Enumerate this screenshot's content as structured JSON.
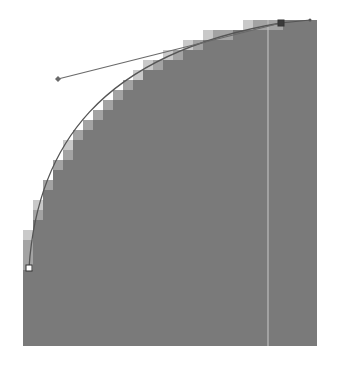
{
  "diagram": {
    "colors": {
      "background": "#ffffff",
      "fill": "#7a7a7a",
      "fill_dark": "#727272",
      "edge_light": "#c9c9c9",
      "edge_mid": "#a3a3a3",
      "path_stroke": "#555555",
      "handle_stroke": "#6a6a6a",
      "guide_line": "#bdbdbd"
    },
    "fill_rect": {
      "x": 23,
      "y": 20,
      "right": 317,
      "bottom": 346
    },
    "pixel_size": 10,
    "guide_x": 268,
    "anchors": [
      {
        "name": "top-anchor",
        "x": 281,
        "y": 23,
        "selected": true
      },
      {
        "name": "bottom-anchor",
        "x": 29,
        "y": 268,
        "selected": false
      }
    ],
    "handle": {
      "from": {
        "x": 281,
        "y": 23
      },
      "to": {
        "x": 58,
        "y": 79
      }
    },
    "top_extension": {
      "x": 310,
      "y": 20
    }
  }
}
